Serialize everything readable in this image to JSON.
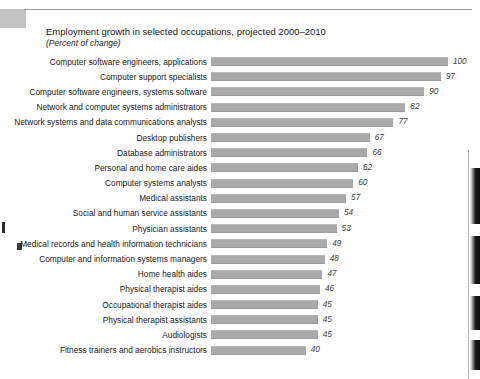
{
  "chart_data": {
    "type": "bar",
    "orientation": "horizontal",
    "title": "Employment growth in selected occupations, projected 2000–2010",
    "subtitle": "(Percent of change)",
    "xlabel": "",
    "ylabel": "",
    "xlim": [
      0,
      100
    ],
    "grid": false,
    "legend": false,
    "bar_color": "#a9a9a9",
    "categories": [
      "Computer software engineers, applications",
      "Computer support specialists",
      "Computer software engineers, systems software",
      "Network and computer systems administrators",
      "Network systems and data communications analysts",
      "Desktop publishers",
      "Database administrators",
      "Personal and home care aides",
      "Computer systems analysts",
      "Medical assistants",
      "Social and human service assistants",
      "Physician assistants",
      "Medical records and health information technicians",
      "Computer and information systems managers",
      "Home health aides",
      "Physical therapist aides",
      "Occupational therapist aides",
      "Physical therapist assistants",
      "Audiologists",
      "Fitness trainers and aerobics instructors"
    ],
    "values": [
      100,
      97,
      90,
      82,
      77,
      67,
      66,
      62,
      60,
      57,
      54,
      53,
      49,
      48,
      47,
      46,
      45,
      45,
      45,
      40
    ],
    "value_labels": [
      "100",
      "97",
      "90",
      "82",
      "77",
      "67",
      "66",
      "62",
      "60",
      "57",
      "54",
      "53",
      "49",
      "48",
      "47",
      "46",
      "45",
      "45",
      "45",
      "40"
    ]
  }
}
